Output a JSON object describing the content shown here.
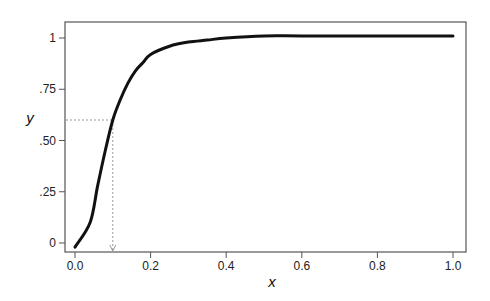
{
  "chart_data": {
    "type": "line",
    "title": "",
    "xlabel": "x",
    "ylabel": "y",
    "xlim": [
      0.0,
      1.0
    ],
    "ylim": [
      0,
      1
    ],
    "grid": false,
    "legend": null,
    "x_ticks": [
      "0.0",
      "0.2",
      "0.4",
      "0.6",
      "0.8",
      "1.0"
    ],
    "y_ticks": [
      "0",
      ".25",
      ".50",
      ".75",
      "1"
    ],
    "series": [
      {
        "name": "curve",
        "x": [
          0.0,
          0.04,
          0.06,
          0.08,
          0.1,
          0.12,
          0.14,
          0.16,
          0.18,
          0.2,
          0.25,
          0.3,
          0.35,
          0.4,
          0.5,
          0.6,
          0.8,
          1.0
        ],
        "y": [
          -0.02,
          0.1,
          0.28,
          0.45,
          0.6,
          0.7,
          0.78,
          0.84,
          0.88,
          0.92,
          0.96,
          0.98,
          0.99,
          1.0,
          1.01,
          1.01,
          1.01,
          1.01
        ]
      }
    ],
    "annotations": [
      {
        "type": "dotted-guide",
        "x": 0.1,
        "y": 0.6,
        "description": "dotted line from y-axis at y≈0.6 to curve, then arrow down to x≈0.1"
      }
    ]
  }
}
